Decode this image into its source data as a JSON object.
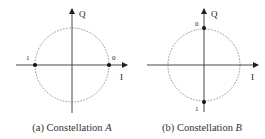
{
  "panels": [
    {
      "id": "a",
      "caption_prefix": "(a) Constellation ",
      "caption_var": "A",
      "axis_labels": {
        "vertical": "Q",
        "horizontal": "I"
      },
      "points": [
        {
          "label": "1",
          "position": "left"
        },
        {
          "label": "0",
          "position": "right"
        }
      ]
    },
    {
      "id": "b",
      "caption_prefix": "(b) Constellation ",
      "caption_var": "B",
      "axis_labels": {
        "vertical": "Q",
        "horizontal": "I"
      },
      "points": [
        {
          "label": "0",
          "position": "top"
        },
        {
          "label": "1",
          "position": "bottom"
        }
      ]
    }
  ]
}
